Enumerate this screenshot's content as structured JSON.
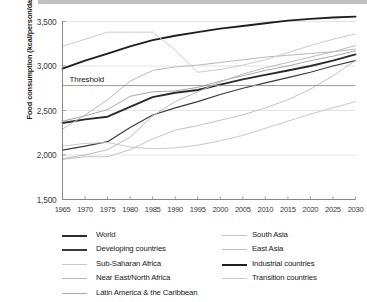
{
  "figure": {
    "ylabel": "Food consumption (kcal/person/day)",
    "threshold_label": "Threshold"
  },
  "chart_data": {
    "type": "line",
    "title": "",
    "xlabel": "",
    "ylabel": "Food consumption (kcal/person/day)",
    "xlim": [
      1965,
      2030
    ],
    "ylim": [
      1500,
      3500
    ],
    "yticks": [
      1500,
      2000,
      2500,
      3000,
      3500
    ],
    "ytick_labels": [
      "1,500",
      "2,000",
      "2,500",
      "3,000",
      "3,500"
    ],
    "xticks": [
      1965,
      1970,
      1975,
      1980,
      1985,
      1990,
      1995,
      2000,
      2005,
      2010,
      2015,
      2020,
      2025,
      2030
    ],
    "xtick_labels": [
      "1965",
      "1970",
      "1975",
      "1980",
      "1985",
      "1990",
      "1995",
      "2000",
      "2005",
      "2010",
      "2015",
      "2020",
      "2025",
      "2030"
    ],
    "grid": "horizontal",
    "legend_position": "below",
    "annotations": [
      {
        "name": "threshold",
        "label": "Threshold",
        "type": "hline",
        "value": 2780
      }
    ],
    "x": [
      1965,
      1970,
      1975,
      1980,
      1985,
      1990,
      1995,
      2000,
      2005,
      2010,
      2015,
      2020,
      2025,
      2030
    ],
    "series": [
      {
        "name": "World",
        "color": "#2b2b2b",
        "width": 1.9,
        "values": [
          2360,
          2400,
          2430,
          2540,
          2650,
          2700,
          2730,
          2790,
          2850,
          2900,
          2950,
          3000,
          3060,
          3130
        ]
      },
      {
        "name": "Developing countries",
        "color": "#3a3a3a",
        "width": 1.2,
        "values": [
          2055,
          2100,
          2150,
          2310,
          2450,
          2530,
          2600,
          2680,
          2750,
          2810,
          2870,
          2930,
          3000,
          3060
        ]
      },
      {
        "name": "Sub-Saharan Africa",
        "color": "#c9c9c9",
        "width": 1.0,
        "values": [
          2100,
          2130,
          2140,
          2090,
          2070,
          2080,
          2110,
          2160,
          2220,
          2300,
          2380,
          2460,
          2530,
          2600
        ]
      },
      {
        "name": "Near East/North Africa",
        "color": "#b9b9b9",
        "width": 1.0,
        "values": [
          2290,
          2450,
          2620,
          2830,
          2950,
          2990,
          3010,
          3040,
          3070,
          3100,
          3120,
          3140,
          3160,
          3190
        ]
      },
      {
        "name": "Latin America & the Caribbean",
        "color": "#a8a8a8",
        "width": 1.0,
        "values": [
          2380,
          2440,
          2510,
          2660,
          2710,
          2720,
          2760,
          2830,
          2890,
          2950,
          3000,
          3060,
          3110,
          3170
        ]
      },
      {
        "name": "South Asia",
        "color": "#c4c4c4",
        "width": 1.0,
        "values": [
          1950,
          1980,
          1980,
          2060,
          2180,
          2280,
          2330,
          2390,
          2450,
          2530,
          2620,
          2740,
          2890,
          3060
        ]
      },
      {
        "name": "East Asia",
        "color": "#bdbdbd",
        "width": 1.0,
        "values": [
          1960,
          2000,
          2060,
          2200,
          2440,
          2600,
          2710,
          2820,
          2910,
          2980,
          3040,
          3100,
          3160,
          3230
        ]
      },
      {
        "name": "Industrial countries",
        "color": "#1f1f1f",
        "width": 1.9,
        "values": [
          2970,
          3060,
          3140,
          3220,
          3290,
          3340,
          3380,
          3420,
          3450,
          3480,
          3510,
          3530,
          3545,
          3555
        ]
      },
      {
        "name": "Transition countries",
        "color": "#cccccc",
        "width": 1.0,
        "values": [
          3220,
          3300,
          3380,
          3380,
          3380,
          3180,
          2930,
          2960,
          3010,
          3070,
          3150,
          3230,
          3300,
          3360
        ]
      }
    ]
  },
  "legend": {
    "left_column": [
      {
        "label": "World",
        "color": "#2b2b2b",
        "width": 1.9
      },
      {
        "label": "Developing countries",
        "color": "#3a3a3a",
        "width": 1.2
      },
      {
        "label": "Sub-Saharan Africa",
        "color": "#c9c9c9",
        "width": 1.0
      },
      {
        "label": "Near East/North Africa",
        "color": "#b9b9b9",
        "width": 1.0
      },
      {
        "label": "Latin America & the Caribbean",
        "color": "#a8a8a8",
        "width": 1.0
      }
    ],
    "right_column": [
      {
        "label": "South Asia",
        "color": "#c4c4c4",
        "width": 1.0
      },
      {
        "label": "East Asia",
        "color": "#bdbdbd",
        "width": 1.0
      },
      {
        "label": "Industrial countries",
        "color": "#1f1f1f",
        "width": 1.9
      },
      {
        "label": "Transition countries",
        "color": "#cccccc",
        "width": 1.0
      }
    ]
  }
}
